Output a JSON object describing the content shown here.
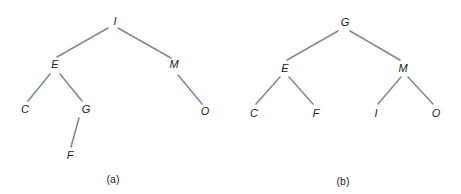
{
  "figure": {
    "colors": {
      "edge": "#7f8c93",
      "text": "#222222",
      "background": "#ffffff"
    },
    "trees": [
      {
        "id": "a",
        "caption": "(a)",
        "caption_pos": [
          113,
          179
        ],
        "nodes": {
          "I": {
            "label": "I",
            "x": 115,
            "y": 21
          },
          "E": {
            "label": "E",
            "x": 55,
            "y": 64
          },
          "M": {
            "label": "M",
            "x": 174,
            "y": 64
          },
          "C": {
            "label": "C",
            "x": 25,
            "y": 109
          },
          "G": {
            "label": "G",
            "x": 86,
            "y": 109
          },
          "O": {
            "label": "O",
            "x": 205,
            "y": 111
          },
          "F": {
            "label": "F",
            "x": 70,
            "y": 155
          }
        },
        "edges": [
          {
            "from": "I",
            "to": "E",
            "x1": 108,
            "y1": 28,
            "x2": 57,
            "y2": 57
          },
          {
            "from": "I",
            "to": "M",
            "x1": 118,
            "y1": 28,
            "x2": 171,
            "y2": 58
          },
          {
            "from": "E",
            "to": "C",
            "x1": 50,
            "y1": 74,
            "x2": 28,
            "y2": 101
          },
          {
            "from": "E",
            "to": "G",
            "x1": 60,
            "y1": 74,
            "x2": 82,
            "y2": 101
          },
          {
            "from": "G",
            "to": "F",
            "x1": 79,
            "y1": 118,
            "x2": 71,
            "y2": 147
          },
          {
            "from": "M",
            "to": "O",
            "x1": 178,
            "y1": 75,
            "x2": 202,
            "y2": 104
          }
        ]
      },
      {
        "id": "b",
        "caption": "(b)",
        "caption_pos": [
          343,
          181
        ],
        "nodes": {
          "G": {
            "label": "G",
            "x": 345,
            "y": 22
          },
          "E": {
            "label": "E",
            "x": 285,
            "y": 68
          },
          "M": {
            "label": "M",
            "x": 403,
            "y": 68
          },
          "C": {
            "label": "C",
            "x": 254,
            "y": 113
          },
          "F": {
            "label": "F",
            "x": 316,
            "y": 113
          },
          "I": {
            "label": "I",
            "x": 376,
            "y": 113
          },
          "O": {
            "label": "O",
            "x": 436,
            "y": 113
          }
        },
        "edges": [
          {
            "from": "G",
            "to": "E",
            "x1": 338,
            "y1": 31,
            "x2": 287,
            "y2": 60
          },
          {
            "from": "G",
            "to": "M",
            "x1": 350,
            "y1": 31,
            "x2": 400,
            "y2": 60
          },
          {
            "from": "E",
            "to": "C",
            "x1": 280,
            "y1": 77,
            "x2": 256,
            "y2": 104
          },
          {
            "from": "E",
            "to": "F",
            "x1": 289,
            "y1": 77,
            "x2": 313,
            "y2": 104
          },
          {
            "from": "M",
            "to": "I",
            "x1": 401,
            "y1": 77,
            "x2": 378,
            "y2": 104
          },
          {
            "from": "M",
            "to": "O",
            "x1": 408,
            "y1": 77,
            "x2": 433,
            "y2": 104
          }
        ]
      }
    ]
  }
}
